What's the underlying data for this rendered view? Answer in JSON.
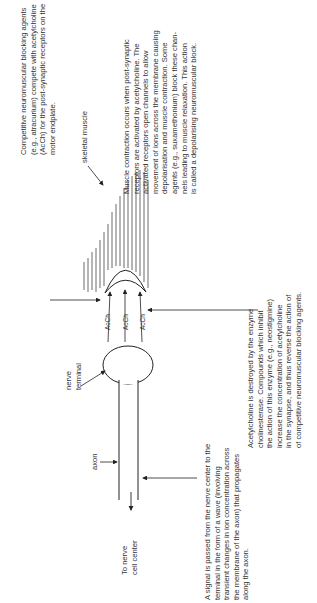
{
  "diagram": {
    "title_orientation": "rotated-90-ccw",
    "labels": {
      "skeletal_muscle": "skeletal muscle",
      "nerve_terminal": [
        "nerve",
        "terminal"
      ],
      "axon": "axon",
      "to_nerve_cell_center": [
        "To nerve",
        "cell center"
      ],
      "acch": [
        "AcCh",
        "AcCh",
        "AcCh"
      ]
    },
    "annotations": {
      "competitive": [
        "Competitive neuromuscular blocking agents",
        "(e.g., atracurium) compete with acetylcholine",
        "(AcCh) for the post-synaptic receptors on the",
        "motor endplate."
      ],
      "muscle_contraction": [
        "Muscle contraction occurs when post-synaptic",
        "receptors are activated by acetylcholine.  The",
        "activated receptors open channels to allow",
        "movement of ions across the membrane causing",
        "depolarisation and muscle contraction.  Some",
        "agents (e.g., suxamethonium) block these chan-",
        "nels leading to muscle relaxation.  This action",
        "is called a depolarising neuromuscular block."
      ],
      "acetylcholine": [
        "Acetylcholine is destroyed by the enzyme",
        "cholinesterase.  Compounds which inhibit",
        "the action of this enzyme (e.g., neostigmine)",
        "increase the concentration of acetylcholine",
        "in the synapse, and thus reverse the action of",
        "of competitive neuromuscular blocking agents."
      ],
      "signal": [
        "A signal is passed from the nerve center to the",
        "terminal in the form of a wave (involving",
        "transient changes in ion concentration across",
        "the membrane of the axon) that propagates",
        "along the axon."
      ]
    }
  }
}
